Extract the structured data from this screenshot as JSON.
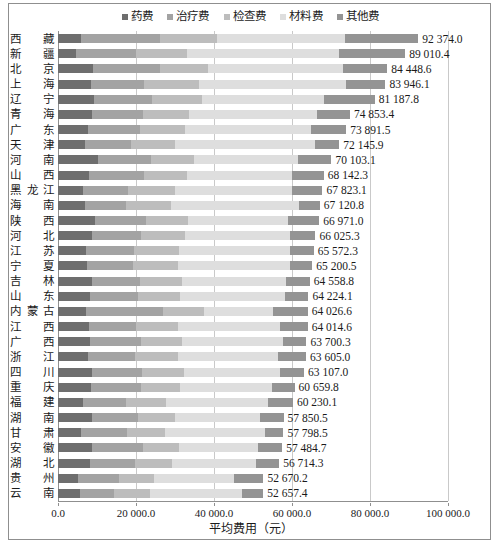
{
  "chart_data": {
    "type": "bar",
    "orientation": "horizontal",
    "stacked": true,
    "title": "",
    "xlabel": "平均费用（元）",
    "ylabel": "",
    "xlim": [
      0,
      100000
    ],
    "xticks": [
      0,
      20000,
      40000,
      60000,
      80000,
      100000
    ],
    "xtick_labels": [
      "0.0",
      "20 000.0",
      "40 000.0",
      "60 000.0",
      "80 000.0",
      "100 000.0"
    ],
    "grid": true,
    "legend_position": "top-center",
    "legend": [
      "药费",
      "治疗费",
      "检查费",
      "材料费",
      "其他费"
    ],
    "series_colors": [
      "#6e6e6e",
      "#a3a3a3",
      "#bdbdbd",
      "#dedede",
      "#949494"
    ],
    "categories": [
      "西藏",
      "新疆",
      "北京",
      "上海",
      "辽宁",
      "青海",
      "广东",
      "天津",
      "河南",
      "山西",
      "黑龙江",
      "海南",
      "陕西",
      "河北",
      "江苏",
      "宁夏",
      "吉林",
      "山东",
      "内蒙古",
      "江西",
      "广西",
      "浙江",
      "四川",
      "重庆",
      "福建",
      "湖南",
      "甘肃",
      "安徽",
      "湖北",
      "贵州",
      "云南"
    ],
    "totals": [
      92374.0,
      89010.4,
      84448.6,
      83946.1,
      81187.8,
      74853.4,
      73891.5,
      72145.9,
      70103.1,
      68142.3,
      67823.1,
      67120.8,
      66971.0,
      66025.3,
      65572.3,
      65200.5,
      64558.8,
      64224.1,
      64026.6,
      64014.6,
      63700.3,
      63605.0,
      63107.0,
      60659.8,
      60230.1,
      57850.5,
      57798.5,
      57484.7,
      56714.3,
      52670.2,
      52657.4
    ],
    "total_labels": [
      "92 374.0",
      "89 010.4",
      "84 448.6",
      "83 946.1",
      "81 187.8",
      "74 853.4",
      "73 891.5",
      "72 145.9",
      "70 103.1",
      "68 142.3",
      "67 823.1",
      "67 120.8",
      "66 971.0",
      "66 025.3",
      "65 572.3",
      "65 200.5",
      "64 558.8",
      "64 224.1",
      "64 026.6",
      "64 014.6",
      "63 700.3",
      "63 605.0",
      "63 107.0",
      "60 659.8",
      "60 230.1",
      "57 850.5",
      "57 798.5",
      "57 484.7",
      "56 714.3",
      "52 670.2",
      "52 657.4"
    ],
    "series": [
      {
        "name": "药费",
        "values": [
          5900,
          4500,
          8900,
          8400,
          9200,
          8800,
          7600,
          6800,
          10200,
          7900,
          6400,
          6900,
          9400,
          8600,
          7300,
          7400,
          8600,
          8300,
          7200,
          7900,
          8300,
          7600,
          8800,
          8500,
          6500,
          8600,
          6000,
          8800,
          8100,
          5200,
          5600
        ]
      },
      {
        "name": "治疗费",
        "values": [
          20200,
          15500,
          17200,
          13600,
          14800,
          12900,
          13400,
          11800,
          13600,
          14200,
          11500,
          10500,
          13200,
          12600,
          12200,
          11900,
          12400,
          12300,
          19800,
          12000,
          12900,
          12200,
          12700,
          12800,
          11000,
          11800,
          11700,
          13000,
          11600,
          10400,
          8700
        ]
      },
      {
        "name": "检查费",
        "values": [
          14600,
          13200,
          12400,
          14100,
          12900,
          11900,
          11500,
          11400,
          11200,
          11000,
          12100,
          11600,
          10800,
          11300,
          11500,
          11400,
          10700,
          10600,
          10400,
          11000,
          10700,
          11100,
          10900,
          9900,
          10100,
          9600,
          9800,
          9200,
          9500,
          9100,
          9300
        ]
      },
      {
        "name": "材料费",
        "values": [
          32800,
          38900,
          34600,
          37800,
          31400,
          32900,
          32300,
          35900,
          26500,
          26900,
          30100,
          32700,
          25700,
          27000,
          28600,
          28900,
          26700,
          27000,
          17800,
          26000,
          25900,
          25500,
          24500,
          23600,
          26200,
          21700,
          25600,
          20200,
          21500,
          20500,
          23500
        ]
      },
      {
        "name": "其他费",
        "values": [
          18874,
          16910,
          11348,
          10046,
          12887,
          8364,
          9091,
          6245,
          8603,
          8143,
          7723,
          5420,
          7871,
          6525,
          5972,
          5607,
          6158,
          6024,
          8826,
          7114,
          5901,
          7205,
          6207,
          5859,
          6430,
          6150,
          4698,
          6284,
          6014,
          7470,
          5557
        ]
      }
    ]
  }
}
